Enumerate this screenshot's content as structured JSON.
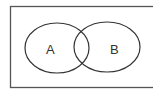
{
  "diagram": {
    "type": "venn",
    "sets": [
      {
        "label": "A"
      },
      {
        "label": "B"
      }
    ],
    "colors": {
      "stroke": "#333333",
      "background": "#ffffff"
    }
  }
}
